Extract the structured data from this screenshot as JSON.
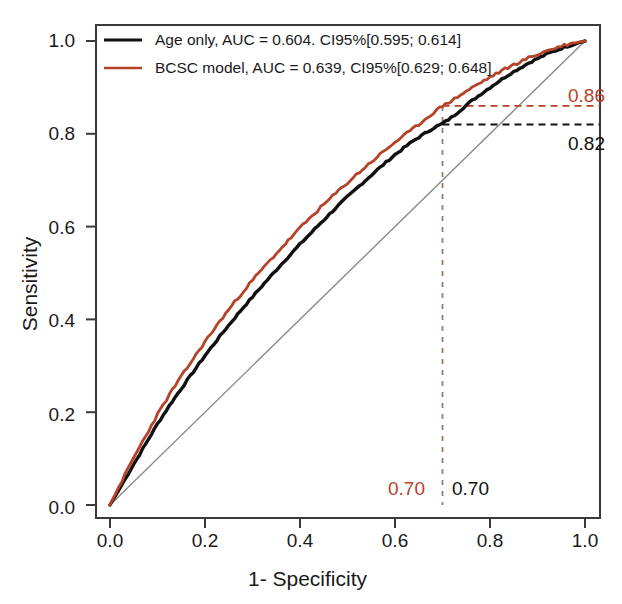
{
  "figure": {
    "type": "roc-curve-plot",
    "background": "#ffffff"
  },
  "axes": {
    "xlabel": "1- Specificity",
    "ylabel": "Sensitivity",
    "xticks": [
      "0.0",
      "0.2",
      "0.4",
      "0.6",
      "0.8",
      "1.0"
    ],
    "yticks": [
      "0.0",
      "0.2",
      "0.4",
      "0.6",
      "0.8",
      "1.0"
    ],
    "xlim": [
      0,
      1
    ],
    "ylim": [
      0,
      1
    ],
    "grid": false,
    "frame_color": "#3a3a3a"
  },
  "legend": {
    "position": "top-left",
    "items": [
      {
        "label": "Age only, AUC = 0.604. CI95%[0.595; 0.614]",
        "color": "#111111",
        "name": "age-only"
      },
      {
        "label": "BCSC model, AUC = 0.639, CI95%[0.629; 0.648]",
        "color": "#b5432a",
        "name": "bcsc-model"
      }
    ]
  },
  "annotations": {
    "sensitivity_bcsc": "0.86",
    "sensitivity_age": "0.82",
    "specificity_bcsc": "0.70",
    "specificity_age": "0.70",
    "bcsc_color": "#b5432a",
    "age_color": "#111111"
  },
  "colors": {
    "bcsc": "#b5432a",
    "age": "#111111",
    "diagonal": "#8a8a8a",
    "dashed_bcsc": "#b5432a",
    "dashed_age": "#111111"
  },
  "chart_data": {
    "type": "line",
    "title": "",
    "xlabel": "1- Specificity",
    "ylabel": "Sensitivity",
    "xlim": [
      0,
      1
    ],
    "ylim": [
      0,
      1
    ],
    "grid": false,
    "legend_position": "top-left",
    "reference_line": {
      "name": "chance-diagonal",
      "x": [
        0,
        1
      ],
      "y": [
        0,
        1
      ],
      "color": "#8a8a8a"
    },
    "series": [
      {
        "name": "Age only",
        "label": "Age only, AUC = 0.604. CI95%[0.595; 0.614]",
        "auc": 0.604,
        "ci95": [
          0.595,
          0.614
        ],
        "color": "#111111",
        "x": [
          0.0,
          0.02,
          0.05,
          0.08,
          0.1,
          0.13,
          0.16,
          0.2,
          0.24,
          0.28,
          0.32,
          0.36,
          0.4,
          0.44,
          0.48,
          0.52,
          0.56,
          0.6,
          0.64,
          0.68,
          0.7,
          0.72,
          0.76,
          0.8,
          0.84,
          0.88,
          0.92,
          0.96,
          1.0
        ],
        "y": [
          0.0,
          0.035,
          0.088,
          0.14,
          0.175,
          0.222,
          0.265,
          0.322,
          0.375,
          0.425,
          0.472,
          0.518,
          0.562,
          0.604,
          0.645,
          0.683,
          0.72,
          0.755,
          0.786,
          0.812,
          0.822,
          0.836,
          0.87,
          0.9,
          0.928,
          0.952,
          0.972,
          0.988,
          1.0
        ]
      },
      {
        "name": "BCSC model",
        "label": "BCSC model, AUC = 0.639, CI95%[0.629; 0.648]",
        "auc": 0.639,
        "ci95": [
          0.629,
          0.648
        ],
        "color": "#b5432a",
        "x": [
          0.0,
          0.02,
          0.05,
          0.08,
          0.1,
          0.13,
          0.16,
          0.2,
          0.24,
          0.28,
          0.32,
          0.36,
          0.4,
          0.44,
          0.48,
          0.52,
          0.56,
          0.6,
          0.64,
          0.68,
          0.7,
          0.72,
          0.76,
          0.8,
          0.84,
          0.88,
          0.92,
          0.96,
          1.0
        ],
        "y": [
          0.0,
          0.042,
          0.102,
          0.158,
          0.195,
          0.246,
          0.292,
          0.352,
          0.408,
          0.46,
          0.508,
          0.553,
          0.597,
          0.638,
          0.676,
          0.713,
          0.748,
          0.782,
          0.812,
          0.845,
          0.86,
          0.872,
          0.898,
          0.922,
          0.944,
          0.963,
          0.979,
          0.992,
          1.0
        ]
      }
    ],
    "marked_point": {
      "x": 0.7,
      "y_bcsc": 0.86,
      "y_age": 0.82
    }
  }
}
